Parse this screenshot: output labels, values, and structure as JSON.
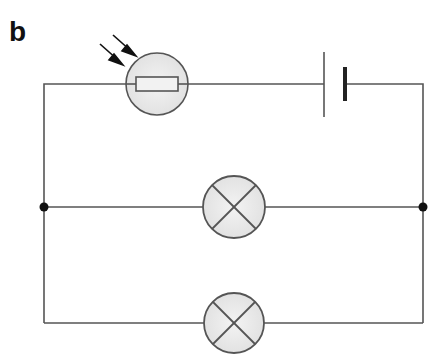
{
  "figure": {
    "panel_label": "b"
  },
  "circuit": {
    "components": [
      {
        "type": "ldr",
        "name": "light-dependent-resistor"
      },
      {
        "type": "cell",
        "name": "battery"
      },
      {
        "type": "lamp",
        "name": "lamp-1"
      },
      {
        "type": "lamp",
        "name": "lamp-2"
      }
    ],
    "junctions": 2,
    "colors": {
      "wire": "#555555",
      "fill": "#ececec",
      "arrow": "#111111",
      "junction": "#111111"
    }
  }
}
